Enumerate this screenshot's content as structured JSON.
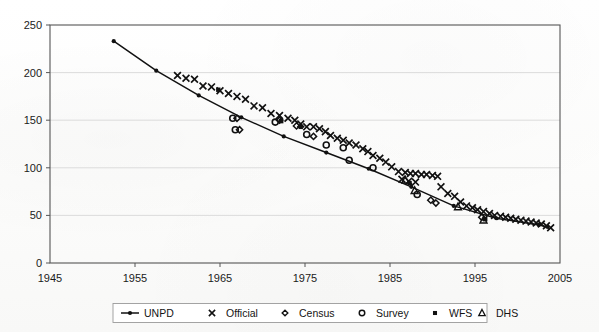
{
  "chart_data": {
    "type": "scatter",
    "title": "",
    "xlabel": "",
    "ylabel": "",
    "xlim": [
      1945,
      2005
    ],
    "ylim": [
      0,
      250
    ],
    "xticks": [
      "1945",
      "1955",
      "1965",
      "1975",
      "1985",
      "1995",
      "2005"
    ],
    "yticks": [
      "0",
      "50",
      "100",
      "150",
      "200",
      "250"
    ],
    "xtick_values": [
      1945,
      1955,
      1965,
      1975,
      1985,
      1995,
      2005
    ],
    "ytick_values": [
      0,
      50,
      100,
      150,
      200,
      250
    ],
    "grid": "horizontal",
    "legend_position": "bottom",
    "series": [
      {
        "name": "UNPD",
        "marker": "line-with-dot",
        "points": [
          [
            1952.5,
            233
          ],
          [
            1957.5,
            202
          ],
          [
            1962.5,
            176
          ],
          [
            1967.5,
            153
          ],
          [
            1972.5,
            133
          ],
          [
            1977.5,
            116
          ],
          [
            1982.5,
            99
          ],
          [
            1987.5,
            80
          ],
          [
            1992.5,
            60
          ],
          [
            1997.5,
            47
          ],
          [
            2002.5,
            40
          ],
          [
            2003.5,
            38
          ]
        ]
      },
      {
        "name": "Official",
        "marker": "x",
        "points": [
          [
            1960.0,
            197
          ],
          [
            1961.0,
            194
          ],
          [
            1962.0,
            193
          ],
          [
            1963.0,
            186
          ],
          [
            1964.0,
            185
          ],
          [
            1965.0,
            181
          ],
          [
            1966.0,
            178
          ],
          [
            1967.0,
            175
          ],
          [
            1968.0,
            172
          ],
          [
            1969.0,
            165
          ],
          [
            1970.0,
            163
          ],
          [
            1971.0,
            157
          ],
          [
            1972.0,
            155
          ],
          [
            1973.0,
            152
          ],
          [
            1973.8,
            150
          ],
          [
            1974.5,
            146
          ],
          [
            1975.2,
            143
          ],
          [
            1976.0,
            143
          ],
          [
            1976.7,
            141
          ],
          [
            1977.4,
            138
          ],
          [
            1978.0,
            134
          ],
          [
            1978.8,
            131
          ],
          [
            1979.5,
            129
          ],
          [
            1980.2,
            126
          ],
          [
            1981.0,
            124
          ],
          [
            1981.8,
            120
          ],
          [
            1982.4,
            117
          ],
          [
            1983.0,
            113
          ],
          [
            1983.8,
            110
          ],
          [
            1984.5,
            106
          ],
          [
            1985.2,
            101
          ],
          [
            1986.0,
            96
          ],
          [
            1986.8,
            95
          ],
          [
            1987.4,
            94
          ],
          [
            1988.0,
            94
          ],
          [
            1988.7,
            93
          ],
          [
            1989.3,
            93
          ],
          [
            1990.0,
            92
          ],
          [
            1990.6,
            91
          ],
          [
            1986.4,
            88
          ],
          [
            1987.2,
            86
          ],
          [
            1988.0,
            85
          ],
          [
            1991.0,
            80
          ],
          [
            1991.8,
            73
          ],
          [
            1992.6,
            70
          ],
          [
            1993.3,
            64
          ],
          [
            1994.0,
            60
          ],
          [
            1994.7,
            58
          ],
          [
            1995.3,
            56
          ],
          [
            1996.0,
            54
          ],
          [
            1996.7,
            52
          ],
          [
            1997.3,
            50
          ],
          [
            1998.0,
            49
          ],
          [
            1998.6,
            48
          ],
          [
            1999.2,
            47
          ],
          [
            1999.8,
            46
          ],
          [
            2000.4,
            45
          ],
          [
            2001.0,
            44
          ],
          [
            2001.6,
            43
          ],
          [
            2002.2,
            42
          ],
          [
            2002.8,
            41
          ],
          [
            2003.4,
            39
          ],
          [
            2003.9,
            37
          ]
        ]
      },
      {
        "name": "Census",
        "marker": "diamond",
        "points": [
          [
            1967.0,
            152
          ],
          [
            1967.3,
            140
          ],
          [
            1972.0,
            150
          ],
          [
            1974.0,
            144
          ],
          [
            1976.0,
            133
          ],
          [
            1989.8,
            66
          ],
          [
            1990.4,
            63
          ],
          [
            1995.8,
            48
          ]
        ]
      },
      {
        "name": "Survey",
        "marker": "circle",
        "points": [
          [
            1966.5,
            152
          ],
          [
            1966.8,
            140
          ],
          [
            1971.5,
            148
          ],
          [
            1975.2,
            135
          ],
          [
            1977.5,
            124
          ],
          [
            1979.5,
            121
          ],
          [
            1980.2,
            108
          ],
          [
            1983.0,
            100
          ],
          [
            1988.2,
            72
          ]
        ]
      },
      {
        "name": "WFS",
        "marker": "filled-square",
        "points": [
          [
            1964.8,
            182
          ],
          [
            1972.2,
            149
          ],
          [
            1974.5,
            143
          ],
          [
            1987.3,
            84
          ],
          [
            1996.2,
            46
          ]
        ]
      },
      {
        "name": "DHS",
        "marker": "triangle",
        "points": [
          [
            1986.8,
            87
          ],
          [
            1987.9,
            76
          ],
          [
            1993.0,
            59
          ],
          [
            1996.0,
            45
          ]
        ]
      }
    ]
  },
  "legend": {
    "items": [
      {
        "label": "UNPD",
        "marker": "line-with-dot"
      },
      {
        "label": "Official",
        "marker": "x"
      },
      {
        "label": "Census",
        "marker": "diamond"
      },
      {
        "label": "Survey",
        "marker": "circle"
      },
      {
        "label": "WFS",
        "marker": "filled-square"
      },
      {
        "label": "DHS",
        "marker": "triangle"
      }
    ]
  },
  "colors": {
    "ink": "#111111",
    "axis": "#555555",
    "grid": "#d8d8d8",
    "background": "#ffffff"
  }
}
